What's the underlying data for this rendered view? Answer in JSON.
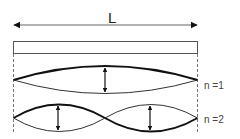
{
  "diagram": {
    "type": "standing-wave-modes",
    "length_label": "L",
    "string_bar": {
      "x": 13,
      "y": 41,
      "width": 185,
      "height": 12
    },
    "modes": [
      {
        "label": "n =1",
        "n": 1,
        "loops": 1
      },
      {
        "label": "n =2",
        "n": 2,
        "loops": 2
      }
    ],
    "colors": {
      "stroke": "#111111",
      "bar_stroke": "#555555",
      "dash": "#777777",
      "background": "#ffffff"
    }
  }
}
